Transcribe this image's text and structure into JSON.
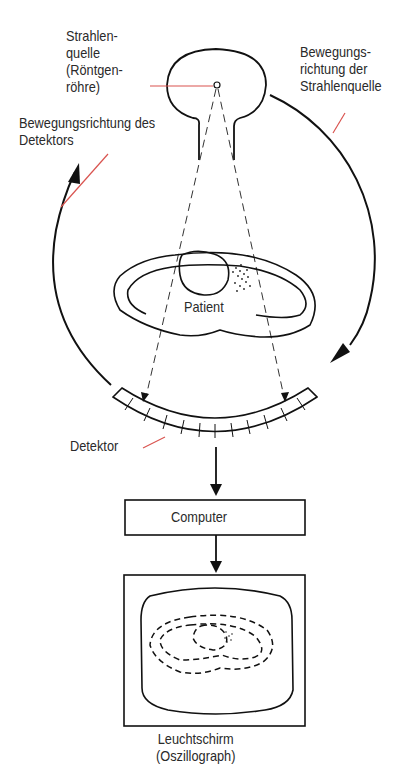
{
  "diagram": {
    "type": "ct-scanner-schematic",
    "labels": {
      "source": "Strahlen-\nquelle\n(Röntgen-\nröhre)",
      "source_direction": "Bewegungs-\nrichtung der\nStrahlenquelle",
      "detector_direction": "Bewegungsrichtung des\nDetektors",
      "patient": "Patient",
      "detector": "Detektor",
      "computer": "Computer",
      "screen": "Leuchtschirm\n(Oszillograph)"
    },
    "colors": {
      "line": "#111111",
      "leader": "#d9534f",
      "text": "#2a2a2a"
    },
    "nodes": [
      {
        "id": "source",
        "label": "Strahlenquelle (Röntgenröhre)"
      },
      {
        "id": "patient",
        "label": "Patient"
      },
      {
        "id": "detector",
        "label": "Detektor",
        "cells": 13
      },
      {
        "id": "computer",
        "label": "Computer"
      },
      {
        "id": "screen",
        "label": "Leuchtschirm (Oszillograph)"
      }
    ],
    "edges": [
      {
        "from": "source",
        "to": "detector",
        "style": "dashed",
        "label": "X-ray fan beam"
      },
      {
        "from": "detector",
        "to": "computer",
        "style": "arrow"
      },
      {
        "from": "computer",
        "to": "screen",
        "style": "arrow"
      }
    ]
  }
}
